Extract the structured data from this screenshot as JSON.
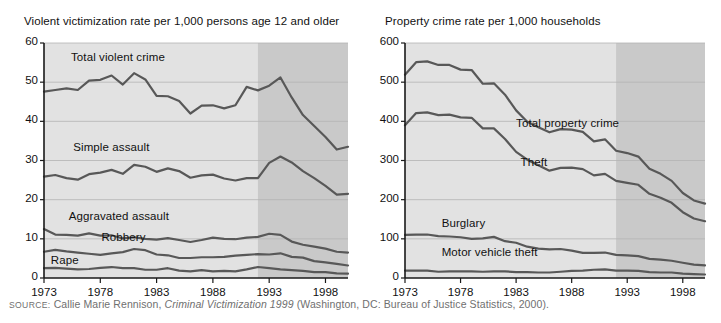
{
  "source_note": {
    "label": "SOURCE:",
    "text_before_italic": " Callie Marie Rennison, ",
    "italic_text": "Criminal Victimization 1999",
    "text_after_italic": " (Washington, DC: Bureau of Justice Statistics, 2000)."
  },
  "colors": {
    "plot_background": "#e2e2e2",
    "shaded_band": "#c9c9c9",
    "line": "#585858",
    "gridline": "#b4b4b4",
    "axis": "#1a1a1a",
    "text": "#111111",
    "source_text": "#6f6f6f"
  },
  "chart_data": [
    {
      "type": "line",
      "id": "violent",
      "title": "Violent victimization rate per 1,000 persons age 12 and older",
      "xlabel": "",
      "ylabel": "",
      "xlim": [
        1973,
        2000
      ],
      "ylim": [
        0,
        60
      ],
      "ytick_values": [
        0,
        10,
        20,
        30,
        40,
        50,
        60
      ],
      "ytick_labels": [
        "0",
        "10",
        "20",
        "30",
        "40",
        "50",
        "60"
      ],
      "xtick_values": [
        1973,
        1978,
        1983,
        1988,
        1993,
        1998
      ],
      "xtick_labels": [
        "1973",
        "1978",
        "1983",
        "1988",
        "1993",
        "1998"
      ],
      "grid": "horizontal",
      "legend": "inline-labels",
      "shaded_region": [
        1992,
        2000
      ],
      "x": [
        1973,
        1974,
        1975,
        1976,
        1977,
        1978,
        1979,
        1980,
        1981,
        1982,
        1983,
        1984,
        1985,
        1986,
        1987,
        1988,
        1989,
        1990,
        1991,
        1992,
        1993,
        1994,
        1995,
        1996,
        1997,
        1998,
        1999,
        2000
      ],
      "series": [
        {
          "name": "Total violent crime",
          "label_x": 1975.4,
          "label_y": 56.0,
          "values": [
            47.6,
            48.0,
            48.4,
            48.0,
            50.4,
            50.6,
            51.7,
            49.4,
            52.3,
            50.7,
            46.5,
            46.4,
            45.2,
            42.0,
            44.0,
            44.1,
            43.3,
            44.1,
            48.8,
            47.9,
            49.1,
            51.2,
            46.1,
            41.6,
            38.8,
            36.0,
            32.8,
            33.5
          ]
        },
        {
          "name": "Simple assault",
          "label_x": 1975.6,
          "label_y": 33.0,
          "values": [
            25.9,
            26.3,
            25.5,
            25.1,
            26.5,
            26.9,
            27.6,
            26.6,
            28.9,
            28.4,
            27.1,
            28.0,
            27.3,
            25.6,
            26.2,
            26.4,
            25.4,
            24.9,
            25.5,
            25.5,
            29.4,
            31.0,
            29.5,
            27.3,
            25.5,
            23.5,
            21.3,
            21.5
          ]
        },
        {
          "name": "Aggravated assault",
          "label_x": 1975.2,
          "label_y": 15.2,
          "values": [
            12.5,
            11.1,
            11.0,
            10.8,
            11.4,
            10.8,
            10.9,
            10.1,
            10.4,
            10.0,
            9.8,
            10.2,
            9.7,
            9.2,
            9.7,
            10.3,
            10.0,
            9.9,
            10.3,
            10.5,
            11.3,
            11.0,
            9.3,
            8.5,
            8.0,
            7.5,
            6.7,
            6.5
          ]
        },
        {
          "name": "Robbery",
          "label_x": 1978.1,
          "label_y": 10.0,
          "values": [
            6.7,
            7.2,
            6.8,
            6.5,
            6.2,
            5.9,
            6.3,
            6.6,
            7.4,
            7.1,
            6.0,
            5.8,
            5.1,
            5.1,
            5.3,
            5.3,
            5.4,
            5.7,
            5.9,
            6.1,
            6.0,
            6.3,
            5.4,
            5.2,
            4.3,
            4.0,
            3.6,
            3.2
          ]
        },
        {
          "name": "Rape",
          "label_x": 1973.6,
          "label_y": 4.2,
          "values": [
            2.5,
            2.6,
            2.4,
            2.2,
            2.3,
            2.6,
            2.8,
            2.5,
            2.5,
            2.1,
            2.1,
            2.5,
            1.9,
            1.7,
            2.0,
            1.7,
            1.8,
            1.7,
            2.2,
            2.8,
            2.5,
            2.2,
            2.0,
            1.8,
            1.5,
            1.5,
            1.2,
            1.1
          ]
        }
      ]
    },
    {
      "type": "line",
      "id": "property",
      "title": "Property crime rate per 1,000 households",
      "xlabel": "",
      "ylabel": "",
      "xlim": [
        1973,
        2000
      ],
      "ylim": [
        0,
        600
      ],
      "ytick_values": [
        0,
        100,
        200,
        300,
        400,
        500,
        600
      ],
      "ytick_labels": [
        "0",
        "100",
        "200",
        "300",
        "400",
        "500",
        "600"
      ],
      "xtick_values": [
        1973,
        1978,
        1983,
        1988,
        1993,
        1998
      ],
      "xtick_labels": [
        "1973",
        "1978",
        "1983",
        "1988",
        "1993",
        "1998"
      ],
      "grid": "horizontal",
      "legend": "inline-labels",
      "shaded_region": [
        1992,
        2000
      ],
      "x": [
        1973,
        1974,
        1975,
        1976,
        1977,
        1978,
        1979,
        1980,
        1981,
        1982,
        1983,
        1984,
        1985,
        1986,
        1987,
        1988,
        1989,
        1990,
        1991,
        1992,
        1993,
        1994,
        1995,
        1996,
        1997,
        1998,
        1999,
        2000
      ],
      "series": [
        {
          "name": "Total property crime",
          "label_x": 1983.0,
          "label_y": 390.0,
          "values": [
            519,
            551,
            553,
            544,
            544,
            532,
            531,
            496,
            497,
            468,
            428,
            399,
            385,
            372,
            380,
            379,
            373,
            349,
            354,
            325,
            319,
            310,
            279,
            266,
            248,
            217,
            198,
            190
          ]
        },
        {
          "name": "Theft",
          "label_x": 1983.4,
          "label_y": 290.0,
          "values": [
            390,
            421,
            423,
            416,
            417,
            410,
            409,
            382,
            382,
            355,
            322,
            302,
            288,
            274,
            281,
            282,
            278,
            262,
            266,
            248,
            243,
            238,
            215,
            205,
            192,
            168,
            152,
            145
          ]
        },
        {
          "name": "Burglary",
          "label_x": 1976.3,
          "label_y": 135.0,
          "values": [
            110,
            111,
            111,
            107,
            106,
            104,
            100,
            101,
            105,
            94,
            90,
            80,
            75,
            73,
            74,
            70,
            64,
            64,
            65,
            59,
            58,
            56,
            49,
            47,
            44,
            39,
            34,
            32
          ]
        },
        {
          "name": "Motor vehicle theft",
          "label_x": 1976.3,
          "label_y": 62.0,
          "values": [
            19,
            19,
            19,
            16,
            17,
            17,
            17,
            16,
            17,
            17,
            15,
            15,
            14,
            14,
            16,
            18,
            19,
            21,
            22,
            19,
            19,
            18,
            15,
            14,
            14,
            11,
            10,
            9
          ]
        }
      ]
    }
  ]
}
